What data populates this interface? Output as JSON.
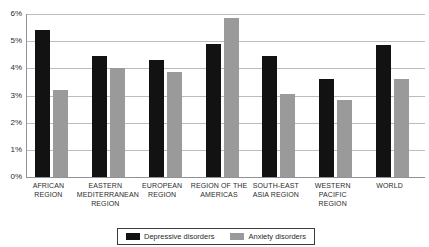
{
  "chart_data": {
    "type": "bar",
    "title": "",
    "xlabel": "",
    "ylabel": "",
    "ylim": [
      0,
      6
    ],
    "ytick_labels": [
      "6%",
      "5%",
      "4%",
      "3%",
      "2%",
      "1%",
      "0%"
    ],
    "ytick_values": [
      6,
      5,
      4,
      3,
      2,
      1,
      0
    ],
    "grid": true,
    "legend_position": "bottom-center",
    "categories": [
      "AFRICAN REGION",
      "EASTERN MEDITERRANEAN REGION",
      "EUROPEAN REGION",
      "REGION OF THE AMERICAS",
      "SOUTH-EAST ASIA REGION",
      "WESTERN PACIFIC REGION",
      "WORLD"
    ],
    "series": [
      {
        "name": "Depressive disorders",
        "color": "#121212",
        "values": [
          5.4,
          4.45,
          4.3,
          4.9,
          4.45,
          3.6,
          4.85
        ]
      },
      {
        "name": "Anxiety disorders",
        "color": "#9a9a9a",
        "values": [
          3.2,
          4.0,
          3.85,
          5.85,
          3.05,
          2.85,
          3.6
        ]
      }
    ]
  }
}
